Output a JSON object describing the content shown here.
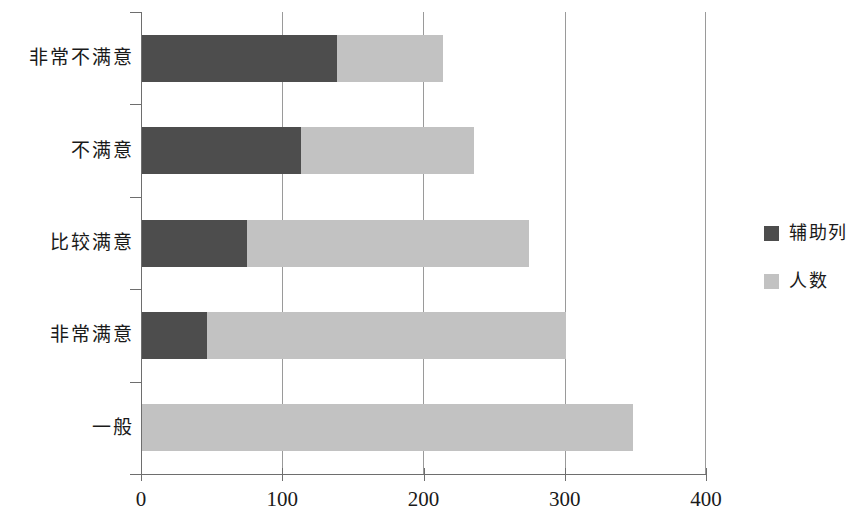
{
  "chart_data": {
    "type": "bar",
    "orientation": "horizontal",
    "stacked": true,
    "title": "",
    "xlabel": "",
    "ylabel": "",
    "xlim": [
      0,
      400
    ],
    "xticks": [
      0,
      100,
      200,
      300,
      400
    ],
    "xtick_labels": [
      "0",
      "100",
      "200",
      "300",
      "400"
    ],
    "grid": true,
    "grid_axis": "x",
    "legend_position": "right",
    "categories": [
      "非常不满意",
      "不满意",
      "比较满意",
      "非常满意",
      "一般"
    ],
    "series": [
      {
        "name": "辅助列",
        "color": "#4d4d4d",
        "values": [
          139,
          113,
          75,
          47,
          0
        ]
      },
      {
        "name": "人数",
        "color": "#c2c2c2",
        "values": [
          75,
          123,
          200,
          254,
          348
        ]
      }
    ],
    "totals": [
      214,
      236,
      275,
      301,
      348
    ]
  },
  "legend": {
    "items": [
      {
        "label": "辅助列",
        "color": "#4d4d4d"
      },
      {
        "label": "人数",
        "color": "#c2c2c2"
      }
    ]
  }
}
